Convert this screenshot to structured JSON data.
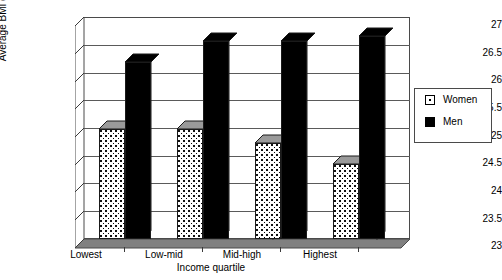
{
  "chart_data": {
    "type": "bar",
    "title": "",
    "subtitle": "",
    "xlabel": "Income quartile",
    "ylabel": "Average BMI (kg/m",
    "ylabel_sup": "2",
    "ylabel_suffix": ")",
    "ylabel_full": "Average BMI (kg/m2)",
    "categories": [
      "Lowest",
      "Low-mid",
      "Mid-high",
      "Highest"
    ],
    "series": [
      {
        "name": "Women",
        "values": [
          25.05,
          25.05,
          24.8,
          24.4
        ],
        "fill": "dotted-stipple",
        "color": "#ffffff"
      },
      {
        "name": "Men",
        "values": [
          26.3,
          26.7,
          26.7,
          26.8
        ],
        "fill": "solid",
        "color": "#000000"
      }
    ],
    "ylim": [
      23,
      27
    ],
    "ytick_step": 0.5,
    "yticks": [
      "27",
      "26.5",
      "26",
      "25.5",
      "25",
      "24.5",
      "24",
      "23.5",
      "23"
    ],
    "grid": true,
    "legend_position": "right",
    "style": "3d-column",
    "plot_border_color": "#4a4a4a",
    "floor_color": "#808080"
  },
  "legend": {
    "items": [
      {
        "label": "Women",
        "swatch": "women-swatch-icon"
      },
      {
        "label": "Men",
        "swatch": "men-swatch-icon"
      }
    ]
  }
}
